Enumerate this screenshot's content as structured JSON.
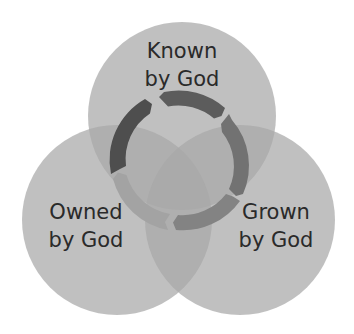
{
  "diagram": {
    "type": "venn-3",
    "circles": [
      {
        "id": "known",
        "line1": "Known",
        "line2": "by God",
        "cx": 182,
        "cy": 116,
        "r": 94
      },
      {
        "id": "owned",
        "line1": "Owned",
        "line2": "by God",
        "cx": 117,
        "cy": 220,
        "r": 95
      },
      {
        "id": "grown",
        "line1": "Grown",
        "line2": "by God",
        "cx": 240,
        "cy": 220,
        "r": 95
      }
    ],
    "center_cycle": {
      "segments": 5,
      "colors": [
        "#5c5c5c",
        "#727272",
        "#838383",
        "#a3a3a3",
        "#4e4e4e"
      ]
    },
    "colors": {
      "circle_fill": "#bdbdbd",
      "background": "#ffffff",
      "text": "#2a2a2a"
    }
  }
}
